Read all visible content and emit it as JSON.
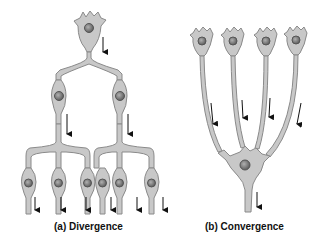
{
  "figure": {
    "panels": [
      {
        "id": "a",
        "caption": "(a) Divergence",
        "description": "One presynaptic neuron branches to two neurons, each of which branches to three neurons (1 → 2 → 6)",
        "levels": [
          1,
          2,
          6
        ]
      },
      {
        "id": "b",
        "caption": "(b) Convergence",
        "description": "Four presynaptic neurons converge onto a single postsynaptic neuron (4 → 1)",
        "levels": [
          4,
          1
        ]
      }
    ],
    "colors": {
      "neuron_fill": "#c8c8c8",
      "neuron_stroke": "#8a8a8a",
      "nucleus": "#7a7a7a",
      "arrow": "#111111",
      "background": "#ffffff"
    }
  }
}
